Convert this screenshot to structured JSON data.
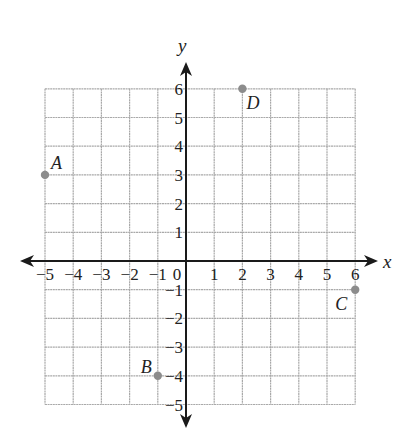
{
  "chart_data": {
    "type": "scatter",
    "title": "",
    "xlabel": "x",
    "ylabel": "y",
    "xlim": [
      -5,
      6
    ],
    "ylim": [
      -5,
      6
    ],
    "grid": true,
    "x_ticks": [
      -5,
      -4,
      -3,
      -2,
      -1,
      0,
      1,
      2,
      3,
      4,
      5,
      6
    ],
    "y_ticks": [
      -5,
      -4,
      -3,
      -2,
      -1,
      1,
      2,
      3,
      4,
      5,
      6
    ],
    "points": [
      {
        "label": "A",
        "x": -5,
        "y": 3
      },
      {
        "label": "B",
        "x": -1,
        "y": -4
      },
      {
        "label": "C",
        "x": 6,
        "y": -1
      },
      {
        "label": "D",
        "x": 2,
        "y": 6
      }
    ],
    "colors": {
      "grid": "#a9a9a9",
      "axis": "#1a1a1a",
      "point": "#8c8c8c"
    }
  }
}
